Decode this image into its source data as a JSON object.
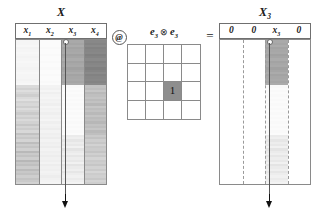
{
  "figure": {
    "type": "matrix-operation-diagram",
    "equation": "X @ (e3 (x) e3) = X3"
  },
  "left_matrix": {
    "title": "X",
    "title_sub": "",
    "columns": [
      {
        "label": "x",
        "sub": "1"
      },
      {
        "label": "x",
        "sub": "2"
      },
      {
        "label": "x",
        "sub": "3"
      },
      {
        "label": "x",
        "sub": "4"
      }
    ],
    "selected_column_index": 2,
    "arrow_marker": "down-arrow"
  },
  "operator_at": {
    "symbol": "@"
  },
  "operator_eq": {
    "symbol": "="
  },
  "kernel": {
    "label_left": "e",
    "label_left_sub": "3",
    "label_tensor": "⊗",
    "label_right": "e",
    "label_right_sub": "3",
    "rows": 4,
    "cols": 4,
    "hot_row": 3,
    "hot_col": 3,
    "hot_value": "1",
    "hot_color": "#8e8e8e"
  },
  "right_matrix": {
    "title": "X",
    "title_sub": "3",
    "columns": [
      {
        "label": "0",
        "sub": ""
      },
      {
        "label": "0",
        "sub": ""
      },
      {
        "label": "x",
        "sub": "3"
      },
      {
        "label": "0",
        "sub": ""
      }
    ],
    "selected_column_index": 2,
    "arrow_marker": "down-arrow"
  },
  "chart_data": {
    "type": "heatmap",
    "xlabel": "",
    "ylabel": "",
    "colormap": "greys",
    "panels": [
      {
        "name": "X",
        "categories": [
          "x1",
          "x2",
          "x3",
          "x4"
        ],
        "n_rows": 64,
        "series": [
          {
            "name": "x1",
            "values": [
              0.05,
              0.05,
              0.04,
              0.06,
              0.05,
              0.04,
              0.05,
              0.06,
              0.05,
              0.04,
              0.05,
              0.05,
              0.06,
              0.05,
              0.04,
              0.05,
              0.05,
              0.06,
              0.05,
              0.04,
              0.18,
              0.22,
              0.16,
              0.2,
              0.24,
              0.18,
              0.15,
              0.22,
              0.19,
              0.24,
              0.17,
              0.21,
              0.26,
              0.2,
              0.24,
              0.18,
              0.22,
              0.28,
              0.21,
              0.25,
              0.19,
              0.3,
              0.23,
              0.27,
              0.21,
              0.32,
              0.25,
              0.29,
              0.23,
              0.34,
              0.26,
              0.3,
              0.24,
              0.35,
              0.28,
              0.31,
              0.25,
              0.33,
              0.27,
              0.3,
              0.24,
              0.29,
              0.26,
              0.22
            ]
          },
          {
            "name": "x2",
            "values": [
              0.02,
              0.02,
              0.02,
              0.03,
              0.02,
              0.02,
              0.03,
              0.02,
              0.02,
              0.03,
              0.02,
              0.02,
              0.03,
              0.02,
              0.02,
              0.03,
              0.02,
              0.02,
              0.03,
              0.02,
              0.06,
              0.07,
              0.05,
              0.08,
              0.06,
              0.05,
              0.07,
              0.06,
              0.08,
              0.05,
              0.07,
              0.06,
              0.08,
              0.06,
              0.07,
              0.05,
              0.08,
              0.06,
              0.07,
              0.09,
              0.06,
              0.08,
              0.07,
              0.09,
              0.06,
              0.08,
              0.07,
              0.09,
              0.06,
              0.08,
              0.07,
              0.09,
              0.07,
              0.08,
              0.06,
              0.09,
              0.07,
              0.08,
              0.06,
              0.07,
              0.09,
              0.07,
              0.06,
              0.05
            ]
          },
          {
            "name": "x3",
            "values": [
              0.42,
              0.44,
              0.41,
              0.45,
              0.43,
              0.42,
              0.46,
              0.44,
              0.41,
              0.45,
              0.43,
              0.42,
              0.46,
              0.44,
              0.41,
              0.45,
              0.43,
              0.42,
              0.44,
              0.41,
              0.03,
              0.02,
              0.03,
              0.02,
              0.03,
              0.02,
              0.03,
              0.02,
              0.03,
              0.02,
              0.03,
              0.02,
              0.03,
              0.02,
              0.03,
              0.02,
              0.03,
              0.02,
              0.03,
              0.02,
              0.03,
              0.02,
              0.1,
              0.08,
              0.12,
              0.09,
              0.11,
              0.07,
              0.13,
              0.1,
              0.08,
              0.12,
              0.09,
              0.11,
              0.07,
              0.13,
              0.1,
              0.08,
              0.12,
              0.09,
              0.07,
              0.1,
              0.08,
              0.06
            ]
          },
          {
            "name": "x4",
            "values": [
              0.58,
              0.6,
              0.57,
              0.61,
              0.59,
              0.58,
              0.62,
              0.6,
              0.57,
              0.61,
              0.59,
              0.58,
              0.62,
              0.6,
              0.57,
              0.61,
              0.59,
              0.58,
              0.6,
              0.57,
              0.3,
              0.32,
              0.28,
              0.34,
              0.31,
              0.29,
              0.33,
              0.3,
              0.35,
              0.28,
              0.32,
              0.3,
              0.34,
              0.29,
              0.33,
              0.31,
              0.35,
              0.3,
              0.32,
              0.28,
              0.34,
              0.31,
              0.26,
              0.3,
              0.24,
              0.28,
              0.22,
              0.27,
              0.25,
              0.29,
              0.23,
              0.27,
              0.21,
              0.26,
              0.24,
              0.28,
              0.22,
              0.26,
              0.2,
              0.25,
              0.23,
              0.27,
              0.21,
              0.24
            ]
          }
        ]
      },
      {
        "name": "e3 (x) e3",
        "type": "grid",
        "values": [
          [
            0,
            0,
            0,
            0
          ],
          [
            0,
            0,
            0,
            0
          ],
          [
            0,
            0,
            1,
            0
          ],
          [
            0,
            0,
            0,
            0
          ]
        ]
      },
      {
        "name": "X3",
        "categories": [
          "0",
          "0",
          "x3",
          "0"
        ],
        "n_rows": 64,
        "series": [
          {
            "name": "0",
            "values": [
              0,
              0,
              0,
              0,
              0,
              0,
              0,
              0,
              0,
              0,
              0,
              0,
              0,
              0,
              0,
              0,
              0,
              0,
              0,
              0,
              0,
              0,
              0,
              0,
              0,
              0,
              0,
              0,
              0,
              0,
              0,
              0,
              0,
              0,
              0,
              0,
              0,
              0,
              0,
              0,
              0,
              0,
              0,
              0,
              0,
              0,
              0,
              0,
              0,
              0,
              0,
              0,
              0,
              0,
              0,
              0,
              0,
              0,
              0,
              0,
              0,
              0,
              0,
              0
            ]
          },
          {
            "name": "0",
            "values": [
              0,
              0,
              0,
              0,
              0,
              0,
              0,
              0,
              0,
              0,
              0,
              0,
              0,
              0,
              0,
              0,
              0,
              0,
              0,
              0,
              0,
              0,
              0,
              0,
              0,
              0,
              0,
              0,
              0,
              0,
              0,
              0,
              0,
              0,
              0,
              0,
              0,
              0,
              0,
              0,
              0,
              0,
              0,
              0,
              0,
              0,
              0,
              0,
              0,
              0,
              0,
              0,
              0,
              0,
              0,
              0,
              0,
              0,
              0,
              0,
              0,
              0,
              0,
              0
            ]
          },
          {
            "name": "x3",
            "values": [
              0.42,
              0.44,
              0.41,
              0.45,
              0.43,
              0.42,
              0.46,
              0.44,
              0.41,
              0.45,
              0.43,
              0.42,
              0.46,
              0.44,
              0.41,
              0.45,
              0.43,
              0.42,
              0.44,
              0.41,
              0.03,
              0.02,
              0.03,
              0.02,
              0.03,
              0.02,
              0.03,
              0.02,
              0.03,
              0.02,
              0.03,
              0.02,
              0.03,
              0.02,
              0.03,
              0.02,
              0.03,
              0.02,
              0.03,
              0.02,
              0.03,
              0.02,
              0.1,
              0.08,
              0.12,
              0.09,
              0.11,
              0.07,
              0.13,
              0.1,
              0.08,
              0.12,
              0.09,
              0.11,
              0.07,
              0.13,
              0.1,
              0.08,
              0.12,
              0.09,
              0.07,
              0.1,
              0.08,
              0.06
            ]
          },
          {
            "name": "0",
            "values": [
              0,
              0,
              0,
              0,
              0,
              0,
              0,
              0,
              0,
              0,
              0,
              0,
              0,
              0,
              0,
              0,
              0,
              0,
              0,
              0,
              0,
              0,
              0,
              0,
              0,
              0,
              0,
              0,
              0,
              0,
              0,
              0,
              0,
              0,
              0,
              0,
              0,
              0,
              0,
              0,
              0,
              0,
              0,
              0,
              0,
              0,
              0,
              0,
              0,
              0,
              0,
              0,
              0,
              0,
              0,
              0,
              0,
              0,
              0,
              0,
              0,
              0,
              0,
              0
            ]
          }
        ]
      }
    ]
  }
}
